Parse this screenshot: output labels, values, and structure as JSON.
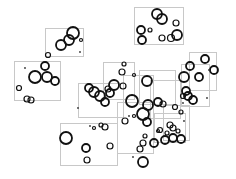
{
  "canvas": {
    "width": 236,
    "height": 179,
    "background": "#ffffff"
  },
  "colors": {
    "frame": "#c8c8c8",
    "ring": "#111111",
    "dot": "#333333"
  },
  "frames": [
    {
      "x": 45,
      "y": 28,
      "w": 38,
      "h": 28
    },
    {
      "x": 14,
      "y": 61,
      "w": 46,
      "h": 39
    },
    {
      "x": 134,
      "y": 7,
      "w": 49,
      "h": 37
    },
    {
      "x": 103,
      "y": 62,
      "w": 31,
      "h": 37
    },
    {
      "x": 78,
      "y": 83,
      "w": 45,
      "h": 34
    },
    {
      "x": 123,
      "y": 75,
      "w": 30,
      "h": 27
    },
    {
      "x": 139,
      "y": 70,
      "w": 36,
      "h": 34
    },
    {
      "x": 150,
      "y": 80,
      "w": 30,
      "h": 38
    },
    {
      "x": 60,
      "y": 123,
      "w": 57,
      "h": 42
    },
    {
      "x": 117,
      "y": 102,
      "w": 36,
      "h": 51
    },
    {
      "x": 154,
      "y": 113,
      "w": 31,
      "h": 29
    },
    {
      "x": 163,
      "y": 105,
      "w": 26,
      "h": 35
    },
    {
      "x": 181,
      "y": 64,
      "w": 28,
      "h": 42
    },
    {
      "x": 189,
      "y": 52,
      "w": 27,
      "h": 38
    }
  ],
  "rings": [
    {
      "cx": 73,
      "cy": 33,
      "r": 6
    },
    {
      "cx": 69,
      "cy": 40,
      "r": 5
    },
    {
      "cx": 61,
      "cy": 45,
      "r": 5
    },
    {
      "cx": 81,
      "cy": 40,
      "r": 1.5
    },
    {
      "cx": 48,
      "cy": 55,
      "r": 2.5
    },
    {
      "cx": 45,
      "cy": 66,
      "r": 4
    },
    {
      "cx": 35,
      "cy": 77,
      "r": 6
    },
    {
      "cx": 47,
      "cy": 77,
      "r": 5
    },
    {
      "cx": 55,
      "cy": 81,
      "r": 4
    },
    {
      "cx": 19,
      "cy": 88,
      "r": 2.5
    },
    {
      "cx": 27,
      "cy": 99,
      "r": 3
    },
    {
      "cx": 31,
      "cy": 100,
      "r": 3
    },
    {
      "cx": 157,
      "cy": 14,
      "r": 5
    },
    {
      "cx": 162,
      "cy": 19,
      "r": 5
    },
    {
      "cx": 141,
      "cy": 30,
      "r": 4
    },
    {
      "cx": 150,
      "cy": 30,
      "r": 2
    },
    {
      "cx": 176,
      "cy": 23,
      "r": 3
    },
    {
      "cx": 142,
      "cy": 40,
      "r": 4
    },
    {
      "cx": 177,
      "cy": 35,
      "r": 5
    },
    {
      "cx": 171,
      "cy": 38,
      "r": 3.5
    },
    {
      "cx": 162,
      "cy": 38,
      "r": 3
    },
    {
      "cx": 124,
      "cy": 64,
      "r": 2
    },
    {
      "cx": 122,
      "cy": 72,
      "r": 3
    },
    {
      "cx": 114,
      "cy": 85,
      "r": 5
    },
    {
      "cx": 123,
      "cy": 86,
      "r": 3
    },
    {
      "cx": 147,
      "cy": 81,
      "r": 5
    },
    {
      "cx": 89,
      "cy": 88,
      "r": 4
    },
    {
      "cx": 94,
      "cy": 92,
      "r": 5
    },
    {
      "cx": 100,
      "cy": 96,
      "r": 5
    },
    {
      "cx": 105,
      "cy": 102,
      "r": 4
    },
    {
      "cx": 110,
      "cy": 93,
      "r": 4
    },
    {
      "cx": 108,
      "cy": 89,
      "r": 3
    },
    {
      "cx": 134,
      "cy": 75,
      "r": 1.5
    },
    {
      "cx": 148,
      "cy": 105,
      "r": 5
    },
    {
      "cx": 132,
      "cy": 101,
      "r": 6
    },
    {
      "cx": 158,
      "cy": 102,
      "r": 4
    },
    {
      "cx": 163,
      "cy": 104,
      "r": 3
    },
    {
      "cx": 190,
      "cy": 66,
      "r": 4
    },
    {
      "cx": 184,
      "cy": 77,
      "r": 5
    },
    {
      "cx": 199,
      "cy": 77,
      "r": 4
    },
    {
      "cx": 186,
      "cy": 91,
      "r": 4
    },
    {
      "cx": 188,
      "cy": 96,
      "r": 4
    },
    {
      "cx": 193,
      "cy": 100,
      "r": 4
    },
    {
      "cx": 205,
      "cy": 59,
      "r": 4
    },
    {
      "cx": 214,
      "cy": 70,
      "r": 4
    },
    {
      "cx": 183,
      "cy": 96,
      "r": 2.5
    },
    {
      "cx": 175,
      "cy": 107,
      "r": 2.5
    },
    {
      "cx": 181,
      "cy": 112,
      "r": 2
    },
    {
      "cx": 66,
      "cy": 138,
      "r": 6
    },
    {
      "cx": 86,
      "cy": 148,
      "r": 4
    },
    {
      "cx": 87,
      "cy": 160,
      "r": 3
    },
    {
      "cx": 101,
      "cy": 125,
      "r": 2
    },
    {
      "cx": 105,
      "cy": 127,
      "r": 3
    },
    {
      "cx": 110,
      "cy": 146,
      "r": 3
    },
    {
      "cx": 94,
      "cy": 128,
      "r": 1.5
    },
    {
      "cx": 143,
      "cy": 114,
      "r": 6
    },
    {
      "cx": 147,
      "cy": 122,
      "r": 4
    },
    {
      "cx": 134,
      "cy": 116,
      "r": 1.5
    },
    {
      "cx": 143,
      "cy": 143,
      "r": 3
    },
    {
      "cx": 140,
      "cy": 149,
      "r": 3
    },
    {
      "cx": 154,
      "cy": 143,
      "r": 4
    },
    {
      "cx": 145,
      "cy": 136,
      "r": 2
    },
    {
      "cx": 143,
      "cy": 162,
      "r": 5
    },
    {
      "cx": 125,
      "cy": 121,
      "r": 3
    },
    {
      "cx": 160,
      "cy": 130,
      "r": 2.5
    },
    {
      "cx": 158,
      "cy": 131,
      "r": 1.5
    },
    {
      "cx": 170,
      "cy": 125,
      "r": 3
    },
    {
      "cx": 173,
      "cy": 128,
      "r": 3
    },
    {
      "cx": 165,
      "cy": 140,
      "r": 4
    },
    {
      "cx": 167,
      "cy": 133,
      "r": 2
    },
    {
      "cx": 173,
      "cy": 138,
      "r": 4
    },
    {
      "cx": 181,
      "cy": 139,
      "r": 4
    },
    {
      "cx": 178,
      "cy": 131,
      "r": 2
    }
  ],
  "dots": [
    {
      "cx": 80,
      "cy": 52
    },
    {
      "cx": 25,
      "cy": 68
    },
    {
      "cx": 78,
      "cy": 108
    },
    {
      "cx": 90,
      "cy": 126
    },
    {
      "cx": 133,
      "cy": 157
    },
    {
      "cx": 129,
      "cy": 116
    },
    {
      "cx": 209,
      "cy": 70
    },
    {
      "cx": 207,
      "cy": 98
    },
    {
      "cx": 183,
      "cy": 103
    },
    {
      "cx": 184,
      "cy": 121
    }
  ]
}
